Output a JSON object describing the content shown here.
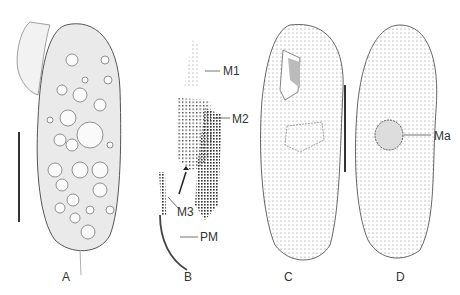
{
  "figure": {
    "panels": [
      {
        "id": "A",
        "label": "A",
        "description": "live ciliate with vacuoles and cilia, scale bar"
      },
      {
        "id": "B",
        "label": "B",
        "description": "oral apparatus detail",
        "annotations": [
          "M1",
          "M2",
          "M3",
          "PM"
        ]
      },
      {
        "id": "C",
        "label": "C",
        "description": "ventral view kineties"
      },
      {
        "id": "D",
        "label": "D",
        "description": "dorsal view kineties",
        "annotations": [
          "Ma"
        ]
      }
    ],
    "annotations": {
      "m1": "M1",
      "m2": "M2",
      "m3": "M3",
      "pm": "PM",
      "ma": "Ma"
    }
  }
}
